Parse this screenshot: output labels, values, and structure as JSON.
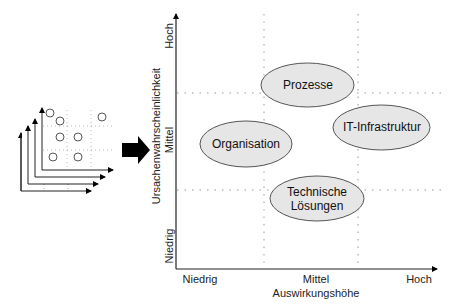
{
  "matrix": {
    "y_axis": {
      "title": "Ursachenwahrscheinlichkeit",
      "ticks": [
        "Niedrig",
        "Mittel",
        "Hoch"
      ]
    },
    "x_axis": {
      "title": "Auswirkungshöhe",
      "ticks": [
        "Niedrig",
        "Mittel",
        "Hoch"
      ]
    },
    "items": [
      {
        "label": "Prozesse",
        "impact": "Mittel",
        "probability": "Hoch/Mittel"
      },
      {
        "label": "Organisation",
        "impact": "Niedrig/Mittel",
        "probability": "Mittel"
      },
      {
        "label": "IT-Infrastruktur",
        "impact": "Hoch",
        "probability": "Mittel"
      },
      {
        "label": "Technische",
        "label2": "Lösungen",
        "impact": "Mittel",
        "probability": "Mittel/Niedrig"
      }
    ]
  },
  "colors": {
    "ellipse_fill": "#e6e6e6",
    "ellipse_stroke": "#555555",
    "axis": "#222222",
    "grid": "#999999",
    "arrow": "#000000"
  },
  "thumbnail": {
    "layers": 4,
    "description": "stacked small risk matrices"
  }
}
